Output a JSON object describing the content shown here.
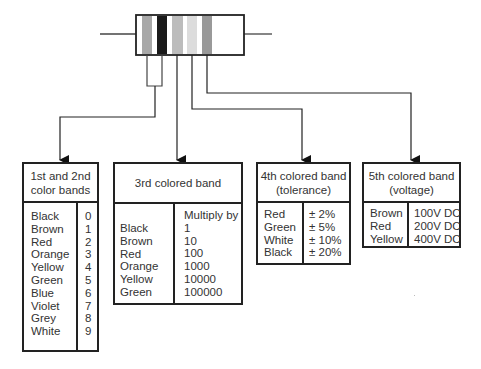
{
  "resistor": {
    "bands": [
      {
        "name": "band-1",
        "color": "#a8a8a8"
      },
      {
        "name": "band-2",
        "color": "#1a1a1a"
      },
      {
        "name": "band-3",
        "color": "#bcbcbc"
      },
      {
        "name": "band-4",
        "color": "#dcdcdc"
      },
      {
        "name": "band-5",
        "color": "#999999"
      }
    ]
  },
  "boxes": {
    "first_second": {
      "title_line1": "1st and 2nd",
      "title_line2": "color bands",
      "colors": [
        "Black",
        "Brown",
        "Red",
        "Orange",
        "Yellow",
        "Green",
        "Blue",
        "Violet",
        "Grey",
        "White"
      ],
      "values": [
        "0",
        "1",
        "2",
        "3",
        "4",
        "5",
        "6",
        "7",
        "8",
        "9"
      ]
    },
    "third": {
      "title": "3rd colored band",
      "value_header": "Multiply by",
      "colors": [
        "Black",
        "Brown",
        "Red",
        "Orange",
        "Yellow",
        "Green"
      ],
      "values": [
        "1",
        "10",
        "100",
        "1000",
        "10000",
        "100000"
      ]
    },
    "fourth": {
      "title_line1": "4th colored band",
      "title_line2": "(tolerance)",
      "colors": [
        "Red",
        "Green",
        "White",
        "Black"
      ],
      "values": [
        "± 2%",
        "± 5%",
        "± 10%",
        "± 20%"
      ]
    },
    "fifth": {
      "title_line1": "5th colored band",
      "title_line2": "(voltage)",
      "colors": [
        "Brown",
        "Red",
        "Yellow"
      ],
      "values": [
        "100V DC",
        "200V DC",
        "400V DC"
      ]
    }
  }
}
